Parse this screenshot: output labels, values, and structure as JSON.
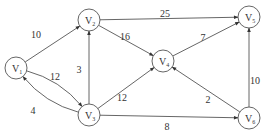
{
  "diagram": {
    "type": "weighted-directed-graph",
    "nodes": [
      {
        "id": "V1",
        "label": "V",
        "sub": "1",
        "x": 16,
        "y": 68
      },
      {
        "id": "V2",
        "label": "V",
        "sub": "2",
        "x": 89,
        "y": 20
      },
      {
        "id": "V3",
        "label": "V",
        "sub": "3",
        "x": 89,
        "y": 115
      },
      {
        "id": "V4",
        "label": "V",
        "sub": "4",
        "x": 163,
        "y": 61
      },
      {
        "id": "V5",
        "label": "V",
        "sub": "5",
        "x": 249,
        "y": 17
      },
      {
        "id": "V6",
        "label": "V",
        "sub": "6",
        "x": 249,
        "y": 118
      }
    ],
    "edges": [
      {
        "from": "V1",
        "to": "V2",
        "weight": "10",
        "lx": 36,
        "ly": 38
      },
      {
        "from": "V1",
        "to": "V3",
        "weight": "12",
        "lx": 55,
        "ly": 80,
        "curve": "upper"
      },
      {
        "from": "V3",
        "to": "V1",
        "weight": "4",
        "lx": 33,
        "ly": 114,
        "curve": "lower"
      },
      {
        "from": "V3",
        "to": "V2",
        "weight": "3",
        "lx": 79,
        "ly": 73
      },
      {
        "from": "V2",
        "to": "V4",
        "weight": "16",
        "lx": 125,
        "ly": 40
      },
      {
        "from": "V2",
        "to": "V5",
        "weight": "25",
        "lx": 165,
        "ly": 17
      },
      {
        "from": "V3",
        "to": "V4",
        "weight": "12",
        "lx": 122,
        "ly": 101
      },
      {
        "from": "V4",
        "to": "V5",
        "weight": "7",
        "lx": 203,
        "ly": 41
      },
      {
        "from": "V3",
        "to": "V6",
        "weight": "8",
        "lx": 167,
        "ly": 130
      },
      {
        "from": "V6",
        "to": "V4",
        "weight": "2",
        "lx": 208,
        "ly": 103
      },
      {
        "from": "V6",
        "to": "V5",
        "weight": "10",
        "lx": 255,
        "ly": 84
      }
    ]
  }
}
